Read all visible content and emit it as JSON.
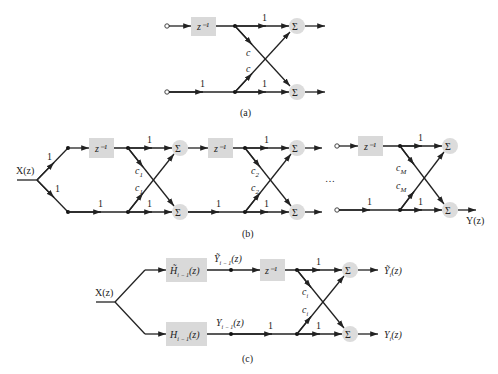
{
  "figure": {
    "a": {
      "caption": "(a)",
      "delay_label": "z⁻¹",
      "gain_top": "1",
      "gain_bottom_in": "1",
      "gain_bottom": "1",
      "cross_gain_down": "c",
      "cross_gain_up": "c",
      "sum_symbol": "Σ"
    },
    "b": {
      "caption": "(b)",
      "input_label": "X(z)",
      "output_label": "Y(z)",
      "branch_gain_up": "1",
      "branch_gain_down": "1",
      "ellipsis": "…",
      "sum_symbol": "Σ",
      "stages": [
        {
          "delay_label": "z⁻¹",
          "gain_top": "1",
          "gain_bottom_in": "1",
          "gain_bottom": "1",
          "coef": "c",
          "coef_sub": "1"
        },
        {
          "delay_label": "z⁻¹",
          "gain_top": "1",
          "gain_bottom_in": "1",
          "gain_bottom": "1",
          "coef": "c",
          "coef_sub": "2"
        },
        {
          "delay_label": "z⁻¹",
          "gain_top": "1",
          "gain_bottom_in": "1",
          "gain_bottom": "1",
          "coef": "c",
          "coef_sub": "M"
        }
      ]
    },
    "c": {
      "caption": "(c)",
      "input_label": "X(z)",
      "upper_filter": {
        "name": "H̃",
        "sub": "i − 1",
        "arg": "(z)"
      },
      "lower_filter": {
        "name": "H",
        "sub": "i − 1",
        "arg": "(z)"
      },
      "upper_signal": {
        "name": "Ỹ",
        "sub": "i − 1",
        "arg": "(z)"
      },
      "lower_signal": {
        "name": "Y",
        "sub": "i − 1",
        "arg": "(z)"
      },
      "delay_label": "z⁻¹",
      "gain_top": "1",
      "gain_bottom_in": "1",
      "gain_bottom": "1",
      "coef": "c",
      "coef_sub": "i",
      "output_upper": {
        "name": "Ỹ",
        "sub": "i",
        "arg": "(z)"
      },
      "output_lower": {
        "name": "Y",
        "sub": "i",
        "arg": "(z)"
      },
      "sum_symbol": "Σ"
    }
  }
}
